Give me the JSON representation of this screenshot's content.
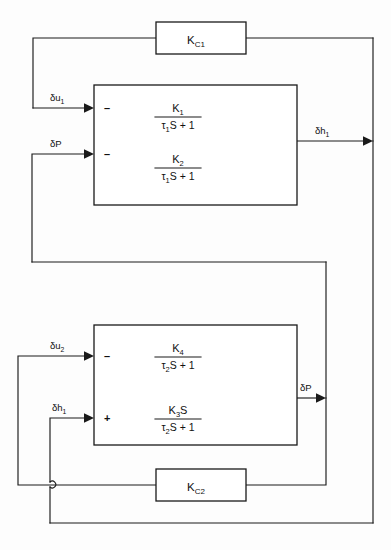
{
  "diagram": {
    "type": "control-block-diagram",
    "title": "",
    "line_color": "#1a1a1a",
    "text_color": "#111111",
    "background_color": "#ffffff"
  },
  "blocks": [
    {
      "id": "kc1",
      "name": "controller-kc1",
      "label_main": "K",
      "label_sub": "C1",
      "kind": "gain"
    },
    {
      "id": "kc2",
      "name": "controller-kc2",
      "label_main": "K",
      "label_sub": "C2",
      "kind": "gain"
    },
    {
      "id": "process1",
      "name": "process-block-upper",
      "kind": "transfer-function-pair",
      "transfer_functions": [
        {
          "numerator_main": "K",
          "numerator_sub": "1",
          "numerator_trail": "",
          "denominator_pre": "τ",
          "denominator_sub": "1",
          "denominator_post": "S + 1",
          "plain": "K1 / (τ1 S + 1)"
        },
        {
          "numerator_main": "K",
          "numerator_sub": "2",
          "numerator_trail": "",
          "denominator_pre": "τ",
          "denominator_sub": "1",
          "denominator_post": "S + 1",
          "plain": "K2 / (τ1 S + 1)"
        }
      ]
    },
    {
      "id": "process2",
      "name": "process-block-lower",
      "kind": "transfer-function-pair",
      "transfer_functions": [
        {
          "numerator_main": "K",
          "numerator_sub": "4",
          "numerator_trail": "",
          "denominator_pre": "τ",
          "denominator_sub": "2",
          "denominator_post": "S + 1",
          "plain": "K4 / (τ2 S + 1)"
        },
        {
          "numerator_main": "K",
          "numerator_sub": "3",
          "numerator_trail": "S",
          "denominator_pre": "τ",
          "denominator_sub": "2",
          "denominator_post": "S + 1",
          "plain": "K3 S / (τ2 S + 1)"
        }
      ]
    }
  ],
  "signals": [
    {
      "id": "du1",
      "name": "signal-delta-u1",
      "main": "δu",
      "sub": "1",
      "plain": "δu1",
      "position": "upper-block-input-top"
    },
    {
      "id": "dp_in",
      "name": "signal-delta-p-input",
      "main": "δP",
      "sub": "",
      "plain": "δP",
      "position": "upper-block-input-bottom"
    },
    {
      "id": "dh1_out",
      "name": "signal-delta-h1-output",
      "main": "δh",
      "sub": "1",
      "plain": "δh1",
      "position": "upper-block-output"
    },
    {
      "id": "du2",
      "name": "signal-delta-u2",
      "main": "δu",
      "sub": "2",
      "plain": "δu2",
      "position": "lower-block-input-top"
    },
    {
      "id": "dh1_in",
      "name": "signal-delta-h1-input",
      "main": "δh",
      "sub": "1",
      "plain": "δh1",
      "position": "lower-block-input-bottom"
    },
    {
      "id": "dp_out",
      "name": "signal-delta-p-output",
      "main": "δP",
      "sub": "",
      "plain": "δP",
      "position": "lower-block-output"
    }
  ],
  "summing_signs": [
    {
      "id": "s1",
      "name": "sign-upper-top",
      "symbol": "–"
    },
    {
      "id": "s2",
      "name": "sign-upper-bottom",
      "symbol": "–"
    },
    {
      "id": "s3",
      "name": "sign-lower-top",
      "symbol": "–"
    },
    {
      "id": "s4",
      "name": "sign-lower-bottom",
      "symbol": "+"
    }
  ]
}
